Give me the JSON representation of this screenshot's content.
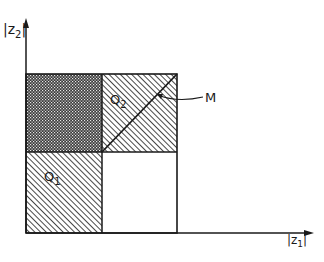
{
  "axes": {
    "y_label": "|z",
    "y_sub": "2",
    "x_label": "|z",
    "x_sub": "1"
  },
  "regions": {
    "q1_label": "Q",
    "q1_sub": "1",
    "q2_label": "Q",
    "q2_sub": "2",
    "m_label": "M"
  },
  "colors": {
    "ink": "#1a1a1a",
    "background": "#ffffff"
  }
}
